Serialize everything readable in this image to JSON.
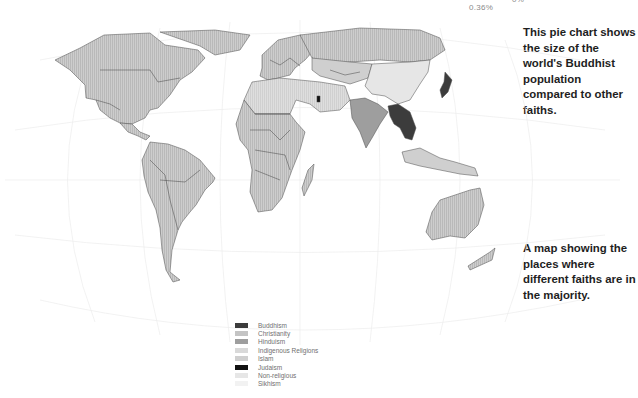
{
  "pie_labels": [
    "0.36%",
    "0%"
  ],
  "captions": {
    "pie": "This pie chart shows the size of the world's Buddhist population compared to other faiths.",
    "map": "A map showing the places where different faiths are in the majority."
  },
  "legend": [
    {
      "label": "Buddhism",
      "color": "#3c3c3c"
    },
    {
      "label": "Christianity",
      "color": "#c4c4c4"
    },
    {
      "label": "Hinduism",
      "color": "#9e9e9e"
    },
    {
      "label": "Indigenous Religions",
      "color": "#d9d9d9"
    },
    {
      "label": "Islam",
      "color": "#cfcfcf"
    },
    {
      "label": "Judaism",
      "color": "#111111"
    },
    {
      "label": "Non-religious",
      "color": "#e6e6e6"
    },
    {
      "label": "Sikhism",
      "color": "#f2f2f2"
    }
  ],
  "regions": [
    {
      "name": "North America",
      "faith": "Christianity"
    },
    {
      "name": "Central America",
      "faith": "Christianity"
    },
    {
      "name": "South America",
      "faith": "Christianity"
    },
    {
      "name": "Europe",
      "faith": "Christianity"
    },
    {
      "name": "Russia",
      "faith": "Christianity"
    },
    {
      "name": "North Africa & Middle East",
      "faith": "Islam"
    },
    {
      "name": "Sub-Saharan Africa",
      "faith": "Christianity"
    },
    {
      "name": "Central Asia",
      "faith": "Islam"
    },
    {
      "name": "China",
      "faith": "Non-religious"
    },
    {
      "name": "India",
      "faith": "Hinduism"
    },
    {
      "name": "Southeast Asia mainland",
      "faith": "Buddhism"
    },
    {
      "name": "Japan",
      "faith": "Buddhism"
    },
    {
      "name": "Israel",
      "faith": "Judaism"
    },
    {
      "name": "Indonesia",
      "faith": "Islam"
    },
    {
      "name": "Australia",
      "faith": "Christianity"
    },
    {
      "name": "Madagascar",
      "faith": "Christianity"
    },
    {
      "name": "Greenland",
      "faith": "Christianity"
    }
  ]
}
